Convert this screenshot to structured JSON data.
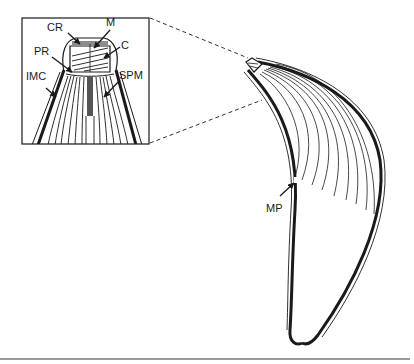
{
  "figure": {
    "inset_labels": {
      "cr": "CR",
      "m": "M",
      "pr": "PR",
      "c": "C",
      "imc": "IMC",
      "spm": "SPM"
    },
    "main_labels": {
      "mp": "MP"
    },
    "colors": {
      "ink": "#1a1a1a",
      "rule": "#9a9a9a",
      "background": "#ffffff"
    }
  }
}
